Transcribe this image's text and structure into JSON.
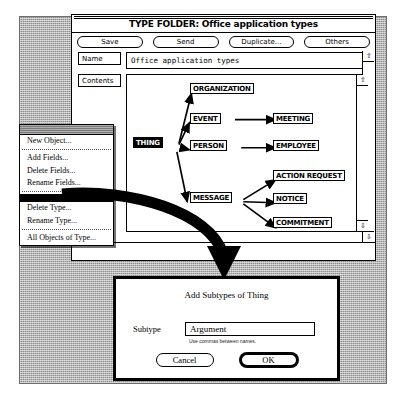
{
  "window": {
    "title": "TYPE FOLDER: Office application types",
    "toolbar": [
      {
        "label": "Save",
        "name": "save-button"
      },
      {
        "label": "Send",
        "name": "send-button"
      },
      {
        "label": "Duplicate...",
        "name": "duplicate-button"
      },
      {
        "label": "Others",
        "name": "others-button"
      }
    ],
    "fields": {
      "name_label": "Name",
      "name_value": "Office application types",
      "contents_label": "Contents"
    }
  },
  "diagram": {
    "nodes": [
      {
        "id": "thing",
        "label": "THING",
        "x": 6,
        "y": 62,
        "selected": true
      },
      {
        "id": "organization",
        "label": "ORGANIZATION",
        "x": 63,
        "y": 8,
        "selected": false
      },
      {
        "id": "event",
        "label": "EVENT",
        "x": 63,
        "y": 38,
        "selected": false
      },
      {
        "id": "person",
        "label": "PERSON",
        "x": 63,
        "y": 65,
        "selected": false
      },
      {
        "id": "message",
        "label": "MESSAGE",
        "x": 63,
        "y": 117,
        "selected": false
      },
      {
        "id": "meeting",
        "label": "MEETING",
        "x": 146,
        "y": 38,
        "selected": false
      },
      {
        "id": "employee",
        "label": "EMPLOYEE",
        "x": 146,
        "y": 65,
        "selected": false
      },
      {
        "id": "action-request",
        "label": "ACTION REQUEST",
        "x": 146,
        "y": 95,
        "selected": false
      },
      {
        "id": "notice",
        "label": "NOTICE",
        "x": 146,
        "y": 118,
        "selected": false
      },
      {
        "id": "commitment",
        "label": "COMMITMENT",
        "x": 146,
        "y": 142,
        "selected": false
      }
    ],
    "edges": [
      {
        "from": "thing",
        "to": "organization"
      },
      {
        "from": "thing",
        "to": "event"
      },
      {
        "from": "thing",
        "to": "person"
      },
      {
        "from": "thing",
        "to": "message"
      },
      {
        "from": "event",
        "to": "meeting"
      },
      {
        "from": "person",
        "to": "employee"
      },
      {
        "from": "message",
        "to": "action-request"
      },
      {
        "from": "message",
        "to": "notice"
      },
      {
        "from": "message",
        "to": "commitment"
      }
    ]
  },
  "menu": {
    "items": [
      {
        "label": "New Object...",
        "name": "menu-item-new-object"
      },
      {
        "label": "Add Fields...",
        "name": "menu-item-add-fields"
      },
      {
        "label": "Delete Fields...",
        "name": "menu-item-delete-fields"
      },
      {
        "label": "Rename Fields...",
        "name": "menu-item-rename-fields"
      },
      {
        "label": "Delete Type...",
        "name": "menu-item-delete-type"
      },
      {
        "label": "Rename Type...",
        "name": "menu-item-rename-type"
      },
      {
        "label": "All Objects of Type...",
        "name": "menu-item-all-objects-of-type"
      }
    ]
  },
  "dialog": {
    "title": "Add Subtypes of Thing",
    "subtype_label": "Subtype",
    "subtype_value": "Argument",
    "subtype_placeholder": "",
    "hint": "Use commas between names.",
    "cancel_label": "Cancel",
    "ok_label": "OK"
  },
  "scroll": {
    "up_glyph": "⇧",
    "down_glyph": "⇩"
  },
  "colors": {
    "desktop": "#8e8e8e",
    "window": "#ffffff",
    "ink": "#000000"
  }
}
